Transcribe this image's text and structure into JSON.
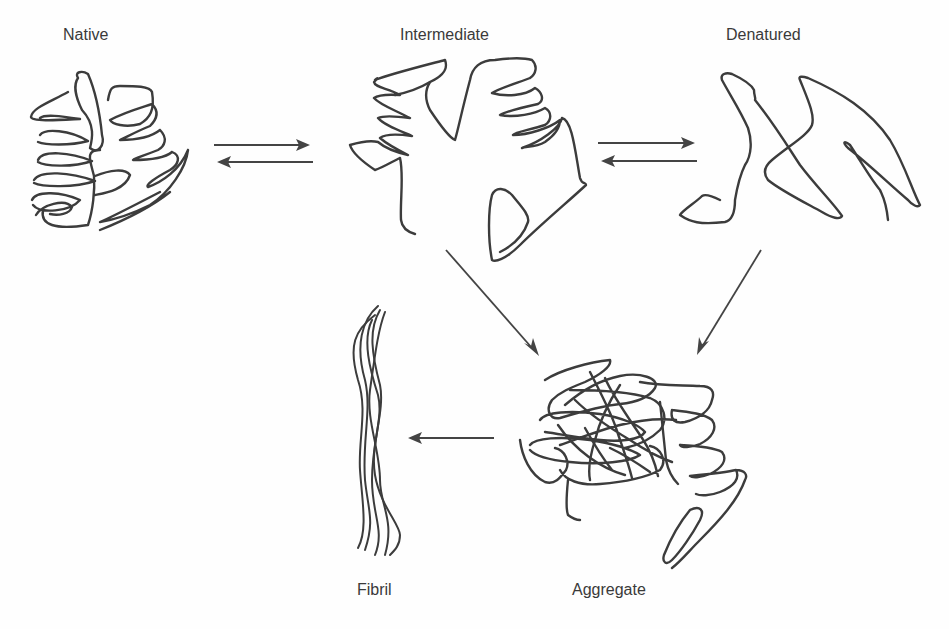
{
  "diagram": {
    "type": "protein folding / aggregation pathway schematic",
    "states": [
      {
        "id": "native",
        "label": "Native"
      },
      {
        "id": "intermediate",
        "label": "Intermediate"
      },
      {
        "id": "denatured",
        "label": "Denatured"
      },
      {
        "id": "aggregate",
        "label": "Aggregate"
      },
      {
        "id": "fibril",
        "label": "Fibril"
      }
    ],
    "transitions": [
      {
        "from": "native",
        "to": "intermediate",
        "reversible": true
      },
      {
        "from": "intermediate",
        "to": "denatured",
        "reversible": true
      },
      {
        "from": "intermediate",
        "to": "aggregate",
        "reversible": false
      },
      {
        "from": "denatured",
        "to": "aggregate",
        "reversible": false
      },
      {
        "from": "aggregate",
        "to": "fibril",
        "reversible": false
      }
    ]
  },
  "colors": {
    "stroke": "#3c3c3c",
    "background": "#fefefe",
    "text": "#3a3a3a"
  }
}
